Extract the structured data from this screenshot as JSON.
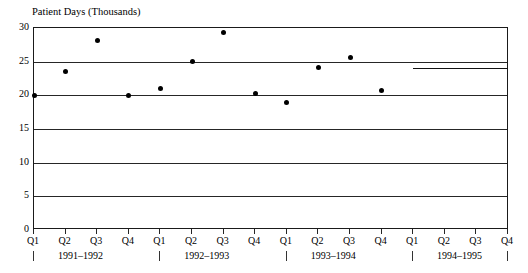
{
  "chart_data": {
    "type": "scatter",
    "title": "Patient Days (Thousands)",
    "xlabel": "",
    "ylabel": "",
    "ylim": [
      0,
      30
    ],
    "ytick_labels": [
      "30",
      "25",
      "20",
      "15",
      "10",
      "5",
      "0"
    ],
    "ytick_values": [
      30,
      25,
      20,
      15,
      10,
      5,
      0
    ],
    "grid": true,
    "legend": "none",
    "categories": [
      "Q1",
      "Q2",
      "Q3",
      "Q4",
      "Q1",
      "Q2",
      "Q3",
      "Q4",
      "Q1",
      "Q2",
      "Q3",
      "Q4",
      "Q1",
      "Q2",
      "Q3",
      "Q4"
    ],
    "groups": [
      {
        "label": "1991–1992",
        "quarters": [
          "Q1",
          "Q2",
          "Q3",
          "Q4"
        ]
      },
      {
        "label": "1992–1993",
        "quarters": [
          "Q1",
          "Q2",
          "Q3",
          "Q4"
        ]
      },
      {
        "label": "1993–1994",
        "quarters": [
          "Q1",
          "Q2",
          "Q3",
          "Q4"
        ]
      },
      {
        "label": "1994–1995",
        "quarters": [
          "Q1",
          "Q2",
          "Q3",
          "Q4"
        ]
      }
    ],
    "series": [
      {
        "name": "Patient Days",
        "marker": "filled-circle",
        "color": "#000000",
        "points": [
          {
            "x": "Q1 1991–1992",
            "index": 0,
            "value": 20.0
          },
          {
            "x": "Q2 1991–1992",
            "index": 1,
            "value": 23.5
          },
          {
            "x": "Q3 1991–1992",
            "index": 2,
            "value": 28.2
          },
          {
            "x": "Q4 1991–1992",
            "index": 3,
            "value": 20.0
          },
          {
            "x": "Q1 1992–1993",
            "index": 4,
            "value": 21.0
          },
          {
            "x": "Q2 1992–1993",
            "index": 5,
            "value": 25.0
          },
          {
            "x": "Q3 1992–1993",
            "index": 6,
            "value": 29.3
          },
          {
            "x": "Q4 1992–1993",
            "index": 7,
            "value": 20.2
          },
          {
            "x": "Q1 1993–1994",
            "index": 8,
            "value": 19.0
          },
          {
            "x": "Q2 1993–1994",
            "index": 9,
            "value": 24.1
          },
          {
            "x": "Q3 1993–1994",
            "index": 10,
            "value": 25.6
          },
          {
            "x": "Q4 1993–1994",
            "index": 11,
            "value": 20.7
          }
        ]
      }
    ],
    "reference_line": {
      "name": "1994–1995 level",
      "value": 24.0,
      "from_index": 12,
      "to_index": 15,
      "color": "#111111"
    },
    "colors": {
      "marker": "#000000",
      "axis": "#1a1a1a",
      "grid": "#262626",
      "background": "#ffffff"
    }
  }
}
